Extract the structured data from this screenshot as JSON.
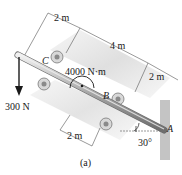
{
  "figure": {
    "caption": "(a)",
    "points": {
      "C": "C",
      "B": "B",
      "A": "A"
    },
    "dimensions": {
      "top_left": "2 m",
      "top_middle": "4 m",
      "top_right": "2 m",
      "bottom": "2 m"
    },
    "loads": {
      "force": "300 N",
      "couple": "4000 N·m"
    },
    "angle": "30°"
  },
  "colors": {
    "shaft": "#9a9a9a",
    "shaft_highlight": "#e6e6e6",
    "plane": "#dcdcdc",
    "wall": "#bfbfbf",
    "ink": "#1a1a1a"
  }
}
